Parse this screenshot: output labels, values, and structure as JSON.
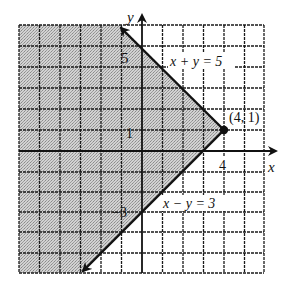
{
  "figure": {
    "type": "linear-inequality-system-graph",
    "axes": {
      "x_label": "x",
      "y_label": "y",
      "x_range": [
        -6,
        6
      ],
      "y_range": [
        -6,
        6
      ],
      "grid": true,
      "grid_step": 1
    },
    "tick_labels": {
      "x_4": "4",
      "y_5": "5",
      "y_1": "1",
      "y_neg3": "−3"
    },
    "lines": [
      {
        "id": "line1",
        "equation": "x + y = 5",
        "label": "x + y = 5",
        "style": "solid",
        "from": [
          4,
          1
        ],
        "to_arrow": [
          -1,
          6
        ]
      },
      {
        "id": "line2",
        "equation": "x − y = 3",
        "label": "x − y = 3",
        "style": "solid",
        "from": [
          4,
          1
        ],
        "to_arrow": [
          -3,
          -6
        ]
      }
    ],
    "vertex": {
      "point": [
        4,
        1
      ],
      "label": "(4, 1)"
    },
    "shaded_region": "x + y ≤ 5 and x − y ≤ 3 (left of both boundary lines)",
    "colors": {
      "grid": "#1a1a1a",
      "shade": "#bdbdbd",
      "line": "#111111",
      "background": "#ffffff"
    }
  }
}
